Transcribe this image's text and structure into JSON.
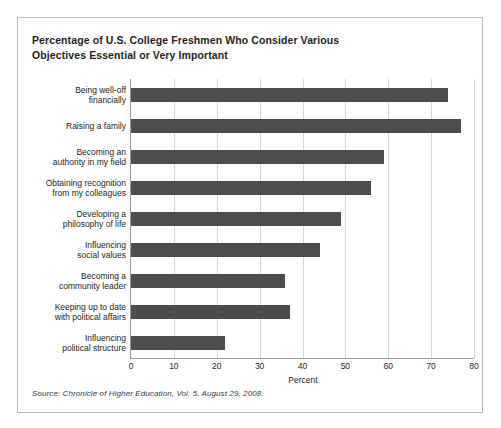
{
  "figure": {
    "title_lines": [
      "Percentage of U.S. College Freshmen Who Consider Various",
      "Objectives Essential or Very Important"
    ],
    "source_note": "Source: Chronicle of Higher Education, Vol. 5, August 29, 2008.",
    "frame_color": "#b9b9b9",
    "bar_color": "#4d4d4d",
    "grid_color": "#d3d3d3",
    "axis_color": "#9a9a9a"
  },
  "chart_data": {
    "type": "bar",
    "orientation": "horizontal",
    "xlabel": "Percent",
    "ylabel": "",
    "xlim": [
      0,
      80
    ],
    "xticks": [
      0,
      10,
      20,
      30,
      40,
      50,
      60,
      70,
      80
    ],
    "xtick_labels": [
      "0",
      "10",
      "20",
      "30",
      "40",
      "50",
      "60",
      "70",
      "80"
    ],
    "grid": "vertical",
    "legend": "none",
    "categories": [
      "Being well-off financially",
      "Raising a family",
      "Becoming an authority in my field",
      "Obtaining recognition from my colleagues",
      "Developing a philosophy of life",
      "Influencing social values",
      "Becoming a community leader",
      "Keeping up to date with political affairs",
      "Influencing political structure"
    ],
    "category_label_lines": [
      [
        "Being well-off",
        "financially"
      ],
      [
        "Raising a family"
      ],
      [
        "Becoming an",
        "authority in my field"
      ],
      [
        "Obtaining recognition",
        "from my colleagues"
      ],
      [
        "Developing a",
        "philosophy of life"
      ],
      [
        "Influencing",
        "social values"
      ],
      [
        "Becoming a",
        "community leader"
      ],
      [
        "Keeping up to date",
        "with political affairs"
      ],
      [
        "Influencing",
        "political structure"
      ]
    ],
    "values": [
      74,
      77,
      59,
      56,
      49,
      44,
      36,
      37,
      22
    ]
  }
}
